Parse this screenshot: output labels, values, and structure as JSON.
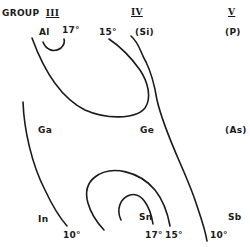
{
  "header": {
    "group_label": "GROUP",
    "columns": [
      {
        "numeral": "III"
      },
      {
        "numeral": "IV"
      },
      {
        "numeral": "V"
      }
    ]
  },
  "elements": {
    "Al": "Al",
    "Si": "(Si)",
    "P": "(P)",
    "Ga": "Ga",
    "Ge": "Ge",
    "As": "(As)",
    "In": "In",
    "Sn": "Sn",
    "Sb": "Sb"
  },
  "contour_labels": {
    "al_17": "17°",
    "top_15": "15°",
    "bottom_left_10": "10°",
    "sn_17": "17°",
    "sn_15": "15°",
    "bottom_right_10": "10°"
  }
}
